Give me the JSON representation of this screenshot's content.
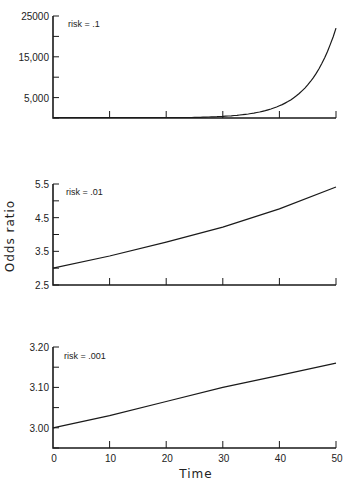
{
  "chart_data": [
    {
      "type": "line",
      "panel": "top",
      "annotation": "risk = .1",
      "x": [
        0,
        5,
        10,
        15,
        20,
        25,
        30,
        35,
        40,
        45,
        50
      ],
      "series": [
        {
          "name": "risk = .1",
          "values": [
            1,
            2.7,
            7.4,
            20,
            55,
            148,
            403,
            1097,
            2981,
            8103,
            22026
          ]
        }
      ],
      "yticks": [
        0,
        5000,
        10000,
        15000,
        20000,
        25000
      ],
      "ytick_labels": [
        "",
        "5,000",
        "",
        "15,000",
        "",
        "25000"
      ],
      "xticks": [
        0,
        10,
        20,
        30,
        40,
        50
      ],
      "ylim": [
        0,
        25000
      ],
      "xlim": [
        0,
        50
      ],
      "grid": false
    },
    {
      "type": "line",
      "panel": "middle",
      "annotation": "risk = .01",
      "x": [
        0,
        10,
        20,
        30,
        40,
        50
      ],
      "series": [
        {
          "name": "risk = .01",
          "values": [
            3.0,
            3.36,
            3.77,
            4.22,
            4.76,
            5.41
          ]
        }
      ],
      "yticks": [
        2.5,
        3.0,
        3.5,
        4.0,
        4.5,
        5.0,
        5.5
      ],
      "ytick_labels": [
        "2.5",
        "",
        "3.5",
        "",
        "4.5",
        "",
        "5.5"
      ],
      "xticks": [
        0,
        10,
        20,
        30,
        40,
        50
      ],
      "ylim": [
        2.5,
        5.5
      ],
      "xlim": [
        0,
        50
      ],
      "ylabel": "Odds ratio",
      "grid": false
    },
    {
      "type": "line",
      "panel": "bottom",
      "annotation": "risk = .001",
      "x": [
        0,
        10,
        20,
        30,
        40,
        50
      ],
      "series": [
        {
          "name": "risk = .001",
          "values": [
            3.0,
            3.03,
            3.065,
            3.1,
            3.13,
            3.16
          ]
        }
      ],
      "yticks": [
        2.95,
        3.0,
        3.05,
        3.1,
        3.15,
        3.2
      ],
      "ytick_labels": [
        "",
        "3.00",
        "",
        "3.10",
        "",
        "3.20"
      ],
      "xticks": [
        0,
        10,
        20,
        30,
        40,
        50
      ],
      "xtick_labels": [
        "0",
        "10",
        "20",
        "30",
        "40",
        "50"
      ],
      "ylim": [
        2.95,
        3.2
      ],
      "xlim": [
        0,
        50
      ],
      "xlabel": "Time",
      "grid": false
    }
  ],
  "labels": {
    "ylabel": "Odds ratio",
    "xlabel": "Time"
  }
}
